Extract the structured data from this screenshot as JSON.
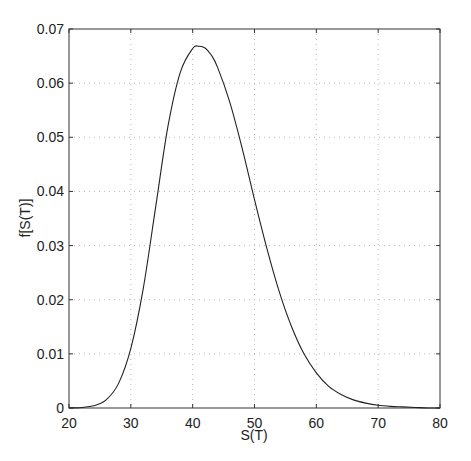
{
  "chart_data": {
    "type": "line",
    "title": "",
    "xlabel": "S(T)",
    "ylabel": "f[S(T)]",
    "xlim": [
      20,
      80
    ],
    "ylim": [
      0,
      0.07
    ],
    "grid": true,
    "xticks": [
      20,
      30,
      40,
      50,
      60,
      70,
      80
    ],
    "xtick_labels": [
      "20",
      "30",
      "40",
      "50",
      "60",
      "70",
      "80"
    ],
    "yticks": [
      0,
      0.01,
      0.02,
      0.03,
      0.04,
      0.05,
      0.06,
      0.07
    ],
    "ytick_labels": [
      "0",
      "0.01",
      "0.02",
      "0.03",
      "0.04",
      "0.05",
      "0.06",
      "0.07"
    ],
    "series": [
      {
        "name": "f[S(T)]",
        "color": "#222222",
        "x": [
          20,
          22,
          24,
          26,
          28,
          30,
          32,
          34,
          36,
          38,
          40,
          41,
          42,
          43,
          44,
          46,
          48,
          50,
          52,
          54,
          56,
          58,
          60,
          62,
          64,
          66,
          68,
          70,
          72,
          74,
          76,
          78,
          80
        ],
        "y": [
          0.0,
          0.0001,
          0.0004,
          0.0015,
          0.0045,
          0.011,
          0.022,
          0.037,
          0.052,
          0.062,
          0.0664,
          0.0668,
          0.0665,
          0.0652,
          0.063,
          0.0565,
          0.048,
          0.0385,
          0.0295,
          0.0215,
          0.015,
          0.01,
          0.0065,
          0.004,
          0.0025,
          0.0015,
          0.0009,
          0.0005,
          0.0003,
          0.0002,
          0.0001,
          0.0,
          0.0
        ]
      }
    ]
  }
}
